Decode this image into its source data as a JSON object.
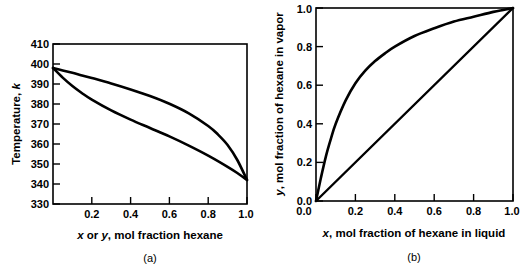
{
  "figure": {
    "background_color": "#ffffff",
    "ink_color": "#000000",
    "panels": [
      {
        "id": "panel-a",
        "caption": "(a)",
        "title": "",
        "xlabel_parts": [
          {
            "text": "x",
            "italic": true
          },
          {
            "text": " or ",
            "italic": false
          },
          {
            "text": "y",
            "italic": true
          },
          {
            "text": ", mol fraction hexane",
            "italic": false
          }
        ],
        "xlabel_plain": "x or y, mol fraction hexane",
        "ylabel_parts": [
          {
            "text": "Temperature, ",
            "italic": false
          },
          {
            "text": "k",
            "italic": true
          }
        ],
        "ylabel_plain": "Temperature, k",
        "xticklabels": [
          "0.2",
          "0.4",
          "0.6",
          "0.8",
          "1.0"
        ],
        "yticklabels": [
          "330",
          "340",
          "350",
          "360",
          "370",
          "380",
          "390",
          "400",
          "410"
        ]
      },
      {
        "id": "panel-b",
        "caption": "(b)",
        "title": "",
        "xlabel_parts": [
          {
            "text": "x",
            "italic": true
          },
          {
            "text": ", mol fraction of hexane in liquid",
            "italic": false
          }
        ],
        "xlabel_plain": "x, mol fraction of hexane in liquid",
        "ylabel_parts": [
          {
            "text": "y",
            "italic": true
          },
          {
            "text": ", mol fraction of hexane in vapor",
            "italic": false
          }
        ],
        "ylabel_plain": "y, mol fraction of hexane in vapor",
        "xticklabels": [
          "0.0",
          "0.2",
          "0.4",
          "0.6",
          "0.8",
          "1.0"
        ],
        "yticklabels": [
          "0.0",
          "0.2",
          "0.4",
          "0.6",
          "0.8",
          "1.0"
        ]
      }
    ]
  },
  "chart_data": [
    {
      "type": "line",
      "id": "panel-a",
      "title": "",
      "subtitle": "",
      "xlabel": "x or y, mol fraction hexane",
      "ylabel": "Temperature, k",
      "xlim": [
        0.0,
        1.0
      ],
      "ylim": [
        330,
        410
      ],
      "xticks": [
        0.0,
        0.2,
        0.4,
        0.6,
        0.8,
        1.0
      ],
      "yticks": [
        330,
        340,
        350,
        360,
        370,
        380,
        390,
        400,
        410
      ],
      "xticklabels": [
        "",
        "0.2",
        "0.4",
        "0.6",
        "0.8",
        "1.0"
      ],
      "yticklabels": [
        "330",
        "340",
        "350",
        "360",
        "370",
        "380",
        "390",
        "400",
        "410"
      ],
      "grid": false,
      "legend": "none",
      "series": [
        {
          "name": "dew-point-curve",
          "x": [
            0.0,
            0.05,
            0.1,
            0.15,
            0.2,
            0.3,
            0.4,
            0.5,
            0.6,
            0.7,
            0.8,
            0.85,
            0.9,
            0.95,
            1.0
          ],
          "values": [
            398.0,
            396.8,
            395.6,
            394.3,
            393.0,
            390.3,
            387.3,
            384.0,
            380.1,
            375.3,
            369.0,
            364.8,
            359.5,
            352.0,
            342.0
          ]
        },
        {
          "name": "bubble-point-curve",
          "x": [
            0.0,
            0.05,
            0.1,
            0.15,
            0.2,
            0.3,
            0.4,
            0.5,
            0.6,
            0.7,
            0.8,
            0.9,
            0.95,
            1.0
          ],
          "values": [
            398.0,
            393.2,
            389.0,
            385.4,
            382.2,
            376.8,
            372.2,
            368.0,
            363.8,
            359.2,
            354.2,
            348.6,
            345.5,
            342.0
          ]
        }
      ]
    },
    {
      "type": "line",
      "id": "panel-b",
      "title": "",
      "subtitle": "",
      "xlabel": "x, mol fraction of hexane in liquid",
      "ylabel": "y, mol fraction of hexane in vapor",
      "xlim": [
        0.0,
        1.0
      ],
      "ylim": [
        0.0,
        1.0
      ],
      "xticks": [
        0.0,
        0.2,
        0.4,
        0.6,
        0.8,
        1.0
      ],
      "yticks": [
        0.0,
        0.2,
        0.4,
        0.6,
        0.8,
        1.0
      ],
      "xticklabels": [
        "0.0",
        "0.2",
        "0.4",
        "0.6",
        "0.8",
        "1.0"
      ],
      "yticklabels": [
        "0.0",
        "0.2",
        "0.4",
        "0.6",
        "0.8",
        "1.0"
      ],
      "grid": false,
      "legend": "none",
      "series": [
        {
          "name": "equilibrium-curve",
          "x": [
            0.0,
            0.025,
            0.05,
            0.075,
            0.1,
            0.15,
            0.2,
            0.25,
            0.3,
            0.35,
            0.4,
            0.5,
            0.6,
            0.7,
            0.8,
            0.9,
            0.95,
            1.0
          ],
          "values": [
            0.0,
            0.12,
            0.23,
            0.32,
            0.4,
            0.52,
            0.61,
            0.675,
            0.725,
            0.765,
            0.8,
            0.855,
            0.895,
            0.93,
            0.955,
            0.98,
            0.99,
            1.0
          ]
        },
        {
          "name": "y-equals-x-diagonal",
          "x": [
            0.0,
            1.0
          ],
          "values": [
            0.0,
            1.0
          ]
        }
      ]
    }
  ]
}
